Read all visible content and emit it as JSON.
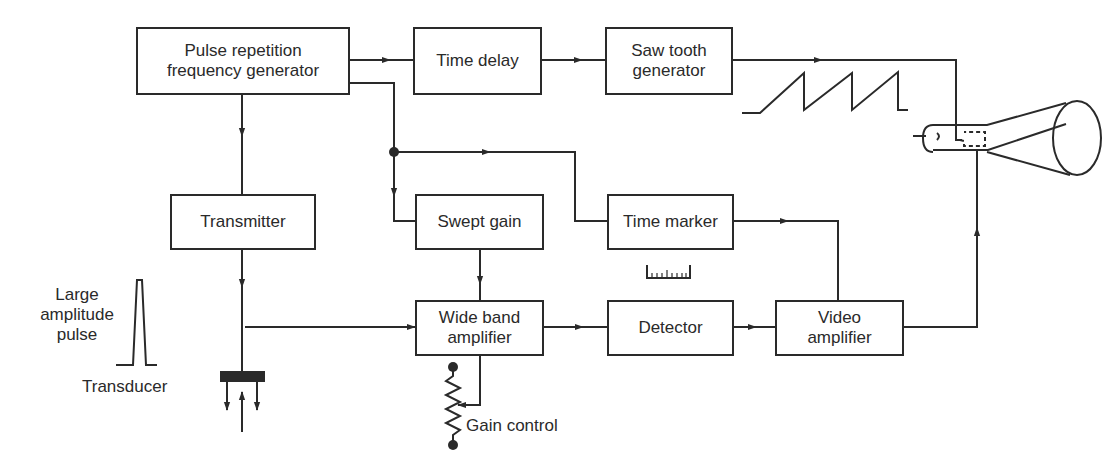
{
  "diagram": {
    "blocks": {
      "prf": "Pulse repetition frequency generator",
      "prf_line1": "Pulse repetition",
      "prf_line2": "frequency generator",
      "time_delay": "Time delay",
      "sawtooth_line1": "Saw tooth",
      "sawtooth_line2": "generator",
      "transmitter": "Transmitter",
      "swept_gain": "Swept gain",
      "time_marker": "Time marker",
      "wideband_line1": "Wide band",
      "wideband_line2": "amplifier",
      "detector": "Detector",
      "video_line1": "Video",
      "video_line2": "amplifier"
    },
    "labels": {
      "pulse_line1": "Large",
      "pulse_line2": "amplitude",
      "pulse_line3": "pulse",
      "transducer": "Transducer",
      "gain_control": "Gain control"
    },
    "connections": [
      {
        "from": "prf",
        "to": "time_delay"
      },
      {
        "from": "time_delay",
        "to": "sawtooth"
      },
      {
        "from": "sawtooth",
        "to": "crt"
      },
      {
        "from": "prf",
        "to": "transmitter"
      },
      {
        "from": "prf",
        "to": "swept_gain"
      },
      {
        "from": "prf",
        "to": "time_marker"
      },
      {
        "from": "transmitter",
        "to": "transducer"
      },
      {
        "from": "transducer",
        "to": "wideband"
      },
      {
        "from": "swept_gain",
        "to": "wideband"
      },
      {
        "from": "wideband",
        "to": "detector"
      },
      {
        "from": "detector",
        "to": "video"
      },
      {
        "from": "time_marker",
        "to": "video"
      },
      {
        "from": "video",
        "to": "crt"
      },
      {
        "from": "gain_control",
        "to": "wideband"
      }
    ],
    "colors": {
      "line": "#2a2a2a",
      "background": "#ffffff"
    }
  }
}
